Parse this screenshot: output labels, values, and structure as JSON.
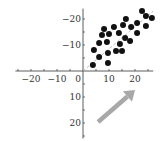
{
  "chart_data": {
    "type": "scatter",
    "title": "",
    "xlabel": "",
    "ylabel": "",
    "xlim": [
      -26,
      27
    ],
    "ylim": [
      -26,
      24
    ],
    "grid": false,
    "x_ticks": [
      -20,
      -10,
      0,
      10,
      20
    ],
    "y_ticks": [
      -20,
      -10,
      10,
      20
    ],
    "x_tick_labels": [
      "−20",
      "−10",
      "0",
      "10",
      "20"
    ],
    "y_tick_labels": [
      "20",
      "10",
      "−10",
      "−20"
    ],
    "trend_line": {
      "style": "dashed",
      "color": "#aaaaaa",
      "from": [
        0,
        0
      ],
      "to": [
        27,
        23
      ]
    },
    "annotation": {
      "type": "arrow",
      "color": "#a8a8a8",
      "from": [
        5.8,
        -19.6
      ],
      "to": [
        20,
        -7.3
      ]
    },
    "points": [
      [
        3.8,
        2.3
      ],
      [
        4.2,
        8.1
      ],
      [
        6.2,
        5.4
      ],
      [
        6.2,
        10.8
      ],
      [
        7.3,
        13.8
      ],
      [
        8.1,
        16.2
      ],
      [
        9.6,
        3.1
      ],
      [
        9.6,
        6.9
      ],
      [
        9.2,
        11.2
      ],
      [
        10.0,
        14.2
      ],
      [
        11.9,
        16.9
      ],
      [
        12.7,
        7.7
      ],
      [
        13.8,
        14.6
      ],
      [
        14.2,
        10.4
      ],
      [
        15.0,
        7.7
      ],
      [
        15.4,
        17.7
      ],
      [
        16.2,
        12.7
      ],
      [
        16.5,
        20.0
      ],
      [
        18.1,
        11.5
      ],
      [
        18.5,
        16.9
      ],
      [
        20.8,
        14.6
      ],
      [
        20.8,
        18.5
      ],
      [
        22.7,
        23.1
      ],
      [
        24.2,
        21.2
      ],
      [
        24.2,
        17.3
      ],
      [
        26.5,
        20.4
      ]
    ],
    "marker": {
      "color": "#111111",
      "size": 6
    }
  }
}
